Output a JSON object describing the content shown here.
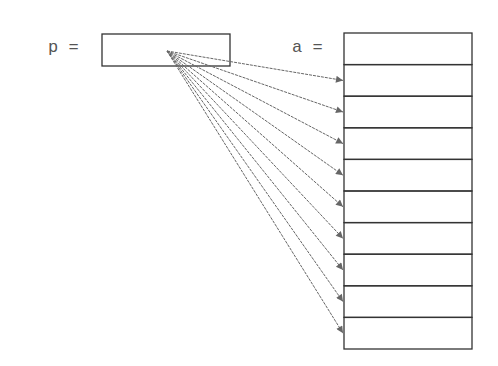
{
  "pointer": {
    "label": "p =",
    "box": {
      "x": 102,
      "y": 34,
      "w": 128,
      "h": 32
    },
    "origin": {
      "x": 167,
      "y": 51
    }
  },
  "array": {
    "label": "a =",
    "x": 344,
    "y": 33,
    "w": 128,
    "cell_h": 31.6,
    "cells": 10,
    "arrow_targets": [
      1,
      2,
      3,
      4,
      5,
      6,
      7,
      8,
      9
    ]
  },
  "colors": {
    "box_stroke": "#333333",
    "arrow": "#666666",
    "text": "#555555"
  }
}
